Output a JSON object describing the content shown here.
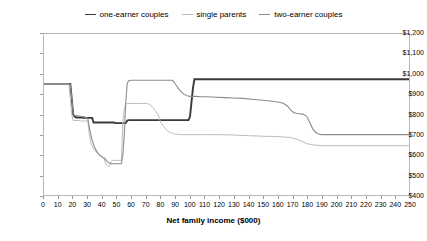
{
  "chart_data": {
    "type": "line",
    "title": "",
    "xlabel": "Net family income ($000)",
    "ylabel": "",
    "xlim": [
      0,
      250
    ],
    "ylim": [
      400,
      1200
    ],
    "xticks": [
      0,
      10,
      20,
      30,
      40,
      50,
      60,
      70,
      80,
      90,
      100,
      110,
      120,
      130,
      140,
      150,
      160,
      170,
      180,
      190,
      200,
      210,
      220,
      230,
      240,
      250
    ],
    "xtick_labels": [
      "0",
      "10",
      "20",
      "30",
      "40",
      "50",
      "60",
      "70",
      "80",
      "90",
      "100",
      "110",
      "120",
      "130",
      "140",
      "150",
      "160",
      "170",
      "180",
      "190",
      "200",
      "210",
      "220",
      "230",
      "240",
      "250"
    ],
    "yticks": [
      400,
      500,
      600,
      700,
      800,
      900,
      1000,
      1100,
      1200
    ],
    "ytick_labels": [
      "$400",
      "$500",
      "$600",
      "$700",
      "$800",
      "$900",
      "$1,000",
      "$1,100",
      "$1,200"
    ],
    "grid": false,
    "legend_position": "top-center",
    "series": [
      {
        "name": "one-earner couples",
        "color": "#3a3a3a",
        "width": 1.9,
        "points": [
          [
            0,
            952
          ],
          [
            17,
            952
          ],
          [
            18,
            952
          ],
          [
            19,
            878
          ],
          [
            20,
            800
          ],
          [
            21,
            790
          ],
          [
            22,
            785
          ],
          [
            26,
            785
          ],
          [
            27,
            783
          ],
          [
            28,
            783
          ],
          [
            33,
            783
          ],
          [
            34,
            760
          ],
          [
            40,
            760
          ],
          [
            48,
            760
          ],
          [
            49,
            757
          ],
          [
            52,
            757
          ],
          [
            56,
            757
          ],
          [
            57,
            770
          ],
          [
            58,
            772
          ],
          [
            72,
            772
          ],
          [
            80,
            772
          ],
          [
            88,
            772
          ],
          [
            94,
            772
          ],
          [
            96,
            772
          ],
          [
            99,
            772
          ],
          [
            100,
            790
          ],
          [
            101,
            860
          ],
          [
            102,
            930
          ],
          [
            103,
            975
          ],
          [
            104,
            975
          ],
          [
            120,
            975
          ],
          [
            150,
            975
          ],
          [
            180,
            975
          ],
          [
            200,
            975
          ],
          [
            230,
            975
          ],
          [
            250,
            975
          ]
        ]
      },
      {
        "name": "single parents",
        "color": "#bdbdbd",
        "width": 1.0,
        "points": [
          [
            0,
            952
          ],
          [
            16,
            952
          ],
          [
            17,
            952
          ],
          [
            18,
            880
          ],
          [
            19,
            800
          ],
          [
            20,
            770
          ],
          [
            24,
            770
          ],
          [
            25,
            768
          ],
          [
            30,
            768
          ],
          [
            31,
            700
          ],
          [
            32,
            660
          ],
          [
            34,
            628
          ],
          [
            36,
            612
          ],
          [
            38,
            600
          ],
          [
            40,
            592
          ],
          [
            41,
            585
          ],
          [
            42,
            560
          ],
          [
            43,
            548
          ],
          [
            44,
            542
          ],
          [
            45,
            545
          ],
          [
            46,
            568
          ],
          [
            47,
            572
          ],
          [
            50,
            572
          ],
          [
            52,
            572
          ],
          [
            53,
            572
          ],
          [
            54,
            760
          ],
          [
            55,
            830
          ],
          [
            56,
            852
          ],
          [
            57,
            855
          ],
          [
            66,
            855
          ],
          [
            70,
            855
          ],
          [
            72,
            852
          ],
          [
            74,
            840
          ],
          [
            76,
            820
          ],
          [
            78,
            800
          ],
          [
            79,
            782
          ],
          [
            80,
            760
          ],
          [
            82,
            740
          ],
          [
            84,
            722
          ],
          [
            86,
            712
          ],
          [
            88,
            706
          ],
          [
            90,
            702
          ],
          [
            94,
            700
          ],
          [
            100,
            700
          ],
          [
            110,
            700
          ],
          [
            120,
            700
          ],
          [
            130,
            698
          ],
          [
            140,
            695
          ],
          [
            150,
            692
          ],
          [
            160,
            690
          ],
          [
            165,
            688
          ],
          [
            170,
            684
          ],
          [
            175,
            672
          ],
          [
            178,
            662
          ],
          [
            180,
            655
          ],
          [
            185,
            648
          ],
          [
            190,
            645
          ],
          [
            200,
            645
          ],
          [
            220,
            645
          ],
          [
            240,
            645
          ],
          [
            250,
            645
          ]
        ]
      },
      {
        "name": "two-earner couples",
        "color": "#8c8c8c",
        "width": 1.1,
        "points": [
          [
            0,
            952
          ],
          [
            17,
            952
          ],
          [
            18,
            950
          ],
          [
            19,
            880
          ],
          [
            20,
            805
          ],
          [
            21,
            795
          ],
          [
            24,
            792
          ],
          [
            26,
            790
          ],
          [
            28,
            788
          ],
          [
            30,
            780
          ],
          [
            31,
            740
          ],
          [
            32,
            700
          ],
          [
            33,
            672
          ],
          [
            34,
            650
          ],
          [
            35,
            632
          ],
          [
            36,
            618
          ],
          [
            37,
            606
          ],
          [
            38,
            598
          ],
          [
            39,
            592
          ],
          [
            40,
            588
          ],
          [
            41,
            585
          ],
          [
            42,
            578
          ],
          [
            43,
            570
          ],
          [
            44,
            562
          ],
          [
            45,
            558
          ],
          [
            46,
            556
          ],
          [
            47,
            555
          ],
          [
            50,
            555
          ],
          [
            52,
            555
          ],
          [
            53,
            555
          ],
          [
            54,
            600
          ],
          [
            55,
            700
          ],
          [
            56,
            860
          ],
          [
            57,
            955
          ],
          [
            58,
            968
          ],
          [
            60,
            970
          ],
          [
            70,
            970
          ],
          [
            80,
            970
          ],
          [
            86,
            970
          ],
          [
            88,
            970
          ],
          [
            89,
            962
          ],
          [
            90,
            950
          ],
          [
            92,
            930
          ],
          [
            94,
            912
          ],
          [
            96,
            900
          ],
          [
            98,
            893
          ],
          [
            100,
            890
          ],
          [
            104,
            890
          ],
          [
            108,
            888
          ],
          [
            112,
            888
          ],
          [
            118,
            886
          ],
          [
            124,
            884
          ],
          [
            130,
            882
          ],
          [
            136,
            880
          ],
          [
            142,
            876
          ],
          [
            148,
            872
          ],
          [
            154,
            868
          ],
          [
            160,
            862
          ],
          [
            164,
            856
          ],
          [
            167,
            840
          ],
          [
            169,
            822
          ],
          [
            171,
            810
          ],
          [
            173,
            805
          ],
          [
            176,
            803
          ],
          [
            178,
            800
          ],
          [
            180,
            790
          ],
          [
            182,
            760
          ],
          [
            184,
            730
          ],
          [
            186,
            712
          ],
          [
            188,
            703
          ],
          [
            190,
            700
          ],
          [
            200,
            700
          ],
          [
            215,
            700
          ],
          [
            230,
            700
          ],
          [
            240,
            700
          ],
          [
            250,
            700
          ]
        ]
      }
    ]
  }
}
